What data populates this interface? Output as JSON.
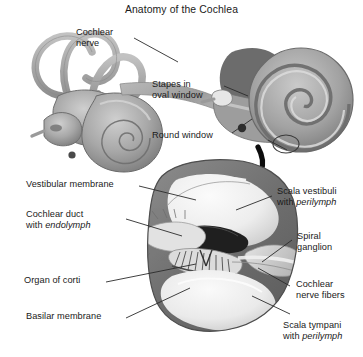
{
  "figure": {
    "title": "Anatomy of the Cochlea",
    "kind": "anatomical-illustration",
    "subject": "cochlea",
    "palette": {
      "background": "#ffffff",
      "text": "#1a1a1a",
      "leader_line": "#2b2b2b",
      "outer_wall_dark": "#6f6f6f",
      "wall_mid": "#8d8d8d",
      "wall_light": "#b4b4b4",
      "chamber_fill": "#ededed",
      "chamber_shade": "#d5d5d5",
      "duct_dark": "#1f1f1f",
      "nerve_gray": "#9a9a9a",
      "arrow_black": "#0d0d0d"
    }
  },
  "panels": [
    {
      "id": "whole-labyrinth",
      "name": "Inner ear labyrinth with semicircular canals and cochlea"
    },
    {
      "id": "cut-cochlea",
      "name": "Sectioned cochlea showing spiral turns"
    },
    {
      "id": "cross-section",
      "name": "Magnified cochlear duct cross-section"
    }
  ],
  "labels": {
    "cochlear_nerve": {
      "line1": "Cochlear",
      "line2": "nerve"
    },
    "stapes_oval_window": {
      "line1": "Stapes in",
      "line2": "oval window"
    },
    "round_window": {
      "line1": "Round window"
    },
    "vestibular_membrane": {
      "line1": "Vestibular membrane"
    },
    "cochlear_duct": {
      "line1": "Cochlear duct",
      "line2_pre": "with ",
      "line2_em": "endolymph"
    },
    "organ_of_corti": {
      "line1": "Organ of corti"
    },
    "basilar_membrane": {
      "line1": "Basilar membrane"
    },
    "scala_vestibuli": {
      "line1": "Scala vestibuli",
      "line2_pre": "with ",
      "line2_em": "perilymph"
    },
    "spiral_ganglion": {
      "line1": "Spiral",
      "line2": "ganglion"
    },
    "cochlear_nerve_fibers": {
      "line1": "Cochlear",
      "line2": "nerve fibers"
    },
    "scala_tympani": {
      "line1": "Scala tympani",
      "line2_pre": "with ",
      "line2_em": "perilymph"
    }
  }
}
